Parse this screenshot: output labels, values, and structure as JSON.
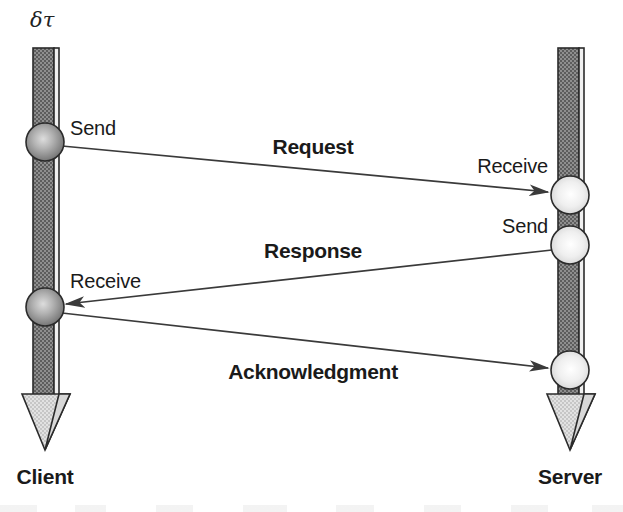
{
  "figure": {
    "type": "sequence-diagram",
    "title_symbol": "δτ",
    "background": "#ffffff",
    "line_color": "#3a3a3a",
    "bar_fill": "#8c8c8c",
    "bar_outline": "#2b2b2b",
    "client_node_color": "#9a9a9a",
    "server_node_color": "#e8e8e8"
  },
  "lifelines": [
    {
      "id": "client",
      "label": "Client",
      "label_x": 45,
      "label_y": 475,
      "axis_x": 45,
      "top_y": 48,
      "bottom_y": 450,
      "tick_label": "δτ",
      "tick_label_x": 38,
      "tick_label_y": 22
    },
    {
      "id": "server",
      "label": "Server",
      "label_x": 570,
      "label_y": 475,
      "axis_x": 570,
      "top_y": 48,
      "bottom_y": 450
    }
  ],
  "events": [
    {
      "id": "client-send",
      "lifeline": "client",
      "label": "Send",
      "x": 45,
      "y": 142,
      "label_x": 70,
      "label_y": 130,
      "align": "left",
      "tone": "dark"
    },
    {
      "id": "server-receive-request",
      "lifeline": "server",
      "label": "Receive",
      "x": 570,
      "y": 195,
      "label_x": 548,
      "label_y": 168,
      "align": "right",
      "tone": "light"
    },
    {
      "id": "server-send",
      "lifeline": "server",
      "label": "Send",
      "x": 570,
      "y": 245,
      "label_x": 548,
      "label_y": 228,
      "align": "right",
      "tone": "light"
    },
    {
      "id": "client-receive",
      "lifeline": "client",
      "label": "Receive",
      "x": 45,
      "y": 307,
      "label_x": 70,
      "label_y": 283,
      "align": "left",
      "tone": "dark"
    },
    {
      "id": "server-receive-ack",
      "lifeline": "server",
      "label": "",
      "x": 570,
      "y": 370,
      "label_x": 0,
      "label_y": 0,
      "align": "right",
      "tone": "light"
    }
  ],
  "messages": [
    {
      "id": "request",
      "label": "Request",
      "from": "client-send",
      "to": "server-receive-request",
      "x1": 62,
      "y1": 146,
      "x2": 548,
      "y2": 192,
      "label_x": 313,
      "label_y": 139
    },
    {
      "id": "response",
      "label": "Response",
      "from": "server-send",
      "to": "client-receive",
      "x1": 552,
      "y1": 250,
      "x2": 66,
      "y2": 304,
      "label_x": 313,
      "label_y": 243
    },
    {
      "id": "acknowledgment",
      "label": "Acknowledgment",
      "from": "client-receive",
      "to": "server-receive-ack",
      "x1": 62,
      "y1": 313,
      "x2": 548,
      "y2": 368,
      "label_x": 313,
      "label_y": 364
    }
  ]
}
